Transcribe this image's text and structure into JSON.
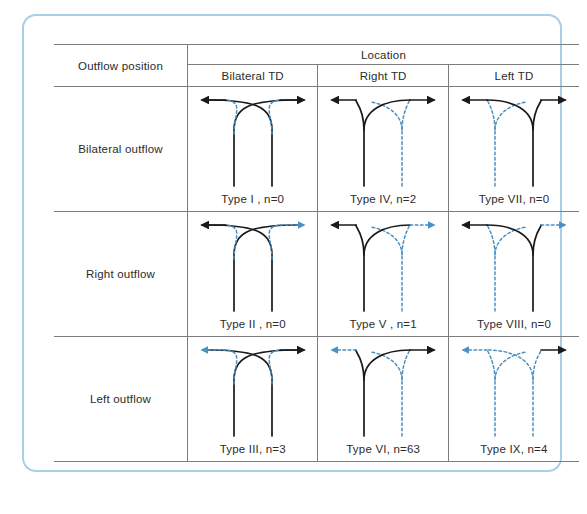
{
  "figure": {
    "frame_border_color": "#a8cfe8",
    "line_color_solid": "#1a1a1a",
    "line_color_dashed": "#4a90c2"
  },
  "table": {
    "corner_header": "Outflow position",
    "group_header": "Location",
    "column_headers": [
      "Bilateral TD",
      "Right TD",
      "Left TD"
    ],
    "row_headers": [
      "Bilateral outflow",
      "Right outflow",
      "Left outflow"
    ],
    "cells": [
      [
        {
          "label": "Type  I , n=0",
          "type": "I",
          "n": 0,
          "left_trunk": "solid",
          "right_trunk": "solid",
          "left_arrow": "solid",
          "right_arrow": "solid",
          "shape": "cross"
        },
        {
          "label": "Type IV, n=2",
          "type": "IV",
          "n": 2,
          "left_trunk": "solid",
          "right_trunk": "dashed",
          "left_arrow": "solid",
          "right_arrow": "solid",
          "shape": "left-dominant"
        },
        {
          "label": "Type VII, n=0",
          "type": "VII",
          "n": 0,
          "left_trunk": "dashed",
          "right_trunk": "solid",
          "left_arrow": "solid",
          "right_arrow": "solid",
          "shape": "right-dominant"
        }
      ],
      [
        {
          "label": "Type  II , n=0",
          "type": "II",
          "n": 0,
          "left_trunk": "solid",
          "right_trunk": "solid",
          "left_arrow": "solid",
          "right_arrow": "dashed",
          "shape": "cross"
        },
        {
          "label": "Type V , n=1",
          "type": "V",
          "n": 1,
          "left_trunk": "solid",
          "right_trunk": "dashed",
          "left_arrow": "solid",
          "right_arrow": "dashed",
          "shape": "left-dominant"
        },
        {
          "label": "Type VIII, n=0",
          "type": "VIII",
          "n": 0,
          "left_trunk": "dashed",
          "right_trunk": "solid",
          "left_arrow": "solid",
          "right_arrow": "dashed",
          "shape": "right-dominant"
        }
      ],
      [
        {
          "label": "Type III, n=3",
          "type": "III",
          "n": 3,
          "left_trunk": "solid",
          "right_trunk": "solid",
          "left_arrow": "dashed",
          "right_arrow": "solid",
          "shape": "cross"
        },
        {
          "label": "Type VI, n=63",
          "type": "VI",
          "n": 63,
          "left_trunk": "solid",
          "right_trunk": "dashed",
          "left_arrow": "dashed",
          "right_arrow": "solid",
          "shape": "left-dominant"
        },
        {
          "label": "Type IX, n=4",
          "type": "IX",
          "n": 4,
          "left_trunk": "dashed",
          "right_trunk": "dashed",
          "left_arrow": "dashed",
          "right_arrow": "solid",
          "shape": "right-dominant"
        }
      ]
    ]
  }
}
